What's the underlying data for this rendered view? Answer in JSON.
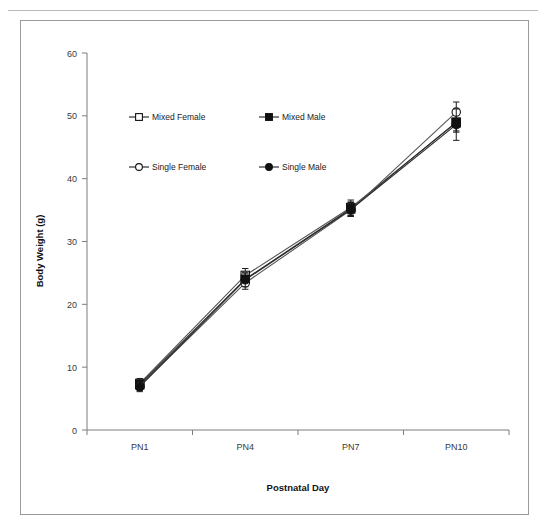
{
  "figure": {
    "border_color": "#9a9a9a",
    "background": "#ffffff"
  },
  "chart_data": {
    "type": "line",
    "title": "",
    "xlabel": "Postnatal Day",
    "ylabel": "Body Weight (g)",
    "categories": [
      "PN1",
      "PN4",
      "PN7",
      "PN10"
    ],
    "xticklabels": [
      "PN1",
      "PN4",
      "PN7",
      "PN10"
    ],
    "yticks": [
      0,
      10,
      20,
      30,
      40,
      50,
      60
    ],
    "yticklabels": [
      "0",
      "10",
      "20",
      "30",
      "40",
      "50",
      "60"
    ],
    "ylim": [
      0,
      60
    ],
    "grid": false,
    "legend_position": "upper-left-inside",
    "series": [
      {
        "name": "Mixed Female",
        "marker": "open-square",
        "values": [
          7.4,
          24.6,
          35.4,
          48.9
        ],
        "errors": [
          0.8,
          1.1,
          1.2,
          1.5
        ]
      },
      {
        "name": "Mixed Male",
        "marker": "filled-square",
        "values": [
          7.2,
          24.0,
          35.2,
          49.0
        ],
        "errors": [
          0.7,
          1.0,
          1.1,
          1.4
        ]
      },
      {
        "name": "Single Female",
        "marker": "open-circle",
        "values": [
          7.0,
          23.4,
          35.0,
          50.6
        ],
        "errors": [
          0.7,
          1.0,
          1.0,
          1.6
        ]
      },
      {
        "name": "Single Male",
        "marker": "filled-circle",
        "values": [
          6.9,
          23.9,
          35.1,
          48.6
        ],
        "errors": [
          0.8,
          1.1,
          1.1,
          2.5
        ]
      }
    ],
    "legend": [
      {
        "label": "Mixed Female",
        "marker": "open-square"
      },
      {
        "label": "Mixed Male",
        "marker": "filled-square"
      },
      {
        "label": "Single Female",
        "marker": "open-circle"
      },
      {
        "label": "Single Male",
        "marker": "filled-circle"
      }
    ]
  }
}
